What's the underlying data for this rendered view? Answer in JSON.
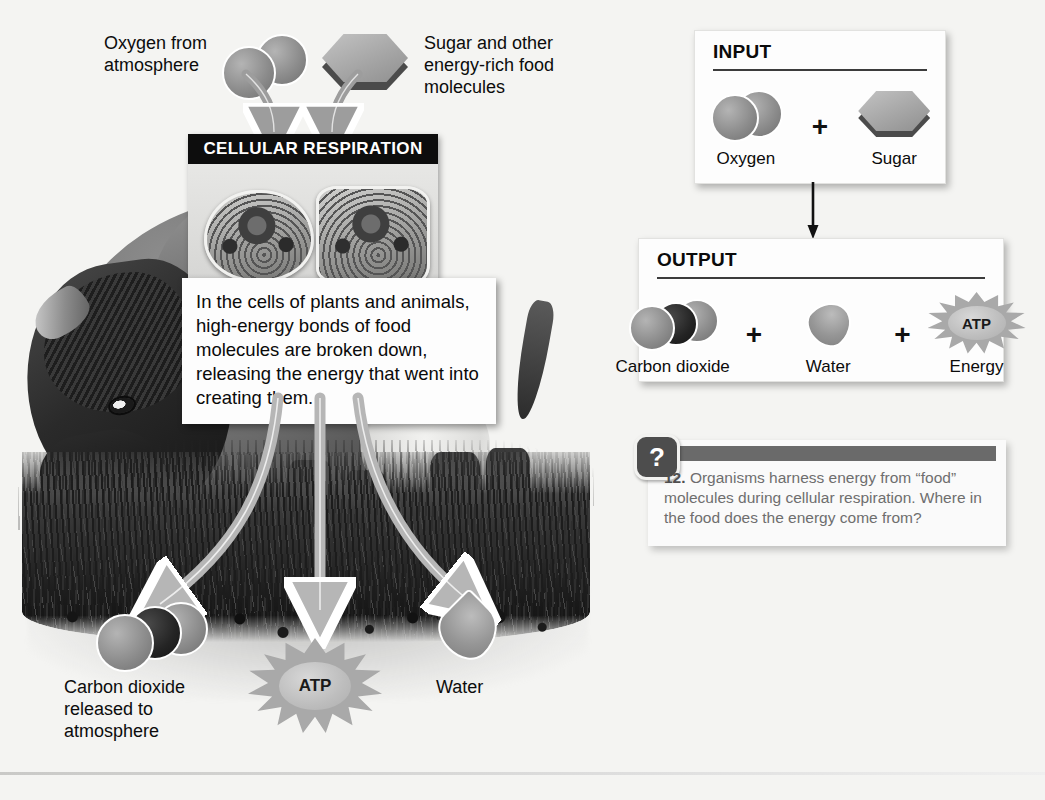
{
  "figure": {
    "topic": "Cellular Respiration",
    "panel_title": "CELLULAR RESPIRATION"
  },
  "scene_labels": {
    "oxygen_in": "Oxygen from\natmosphere",
    "oxygen_in_line1": "Oxygen from",
    "oxygen_in_line2": "atmosphere",
    "sugar_in_line1": "Sugar and other",
    "sugar_in_line2": "energy-rich food",
    "sugar_in_line3": "molecules",
    "co2_out_line1": "Carbon dioxide",
    "co2_out_line2": "released to",
    "co2_out_line3": "atmosphere",
    "atp_label": "ATP",
    "water_out": "Water"
  },
  "callout": {
    "text": "In the cells of plants and animals, high-energy bonds of food molecules are broken down, releasing the energy that went into creating them."
  },
  "input_box": {
    "heading": "INPUT",
    "items": [
      {
        "icon": "oxygen-molecule-icon",
        "label": "Oxygen"
      },
      {
        "icon": "sugar-hexagon-icon",
        "label": "Sugar"
      }
    ],
    "operators": [
      "+"
    ]
  },
  "output_box": {
    "heading": "OUTPUT",
    "items": [
      {
        "icon": "carbon-dioxide-molecule-icon",
        "label": "Carbon dioxide"
      },
      {
        "icon": "water-droplet-icon",
        "label": "Water"
      },
      {
        "icon": "atp-starburst-icon",
        "label": "Energy",
        "inner_label": "ATP"
      }
    ],
    "operators": [
      "+",
      "+"
    ]
  },
  "flow_arrow": {
    "direction": "down",
    "from": "INPUT",
    "to": "OUTPUT"
  },
  "question": {
    "icon": "question-mark-icon",
    "icon_glyph": "?",
    "number": "12.",
    "text": "Organisms harness energy from “food” molecules during cellular respiration. Where in the food does the energy come from?"
  },
  "colors": {
    "page_background": "#f4f4f2",
    "panel_title_background": "#0d0d0d",
    "panel_title_text": "#ffffff",
    "molecule_gray": "#8d8d8d",
    "molecule_dark": "#242424",
    "box_background": "#fdfdfd",
    "rule": "#3c3c3c",
    "question_bar": "#6a6a6a",
    "question_text": "#6e6e6e",
    "arrow_fill": "#a9a9a9",
    "arrow_stroke": "#ffffff"
  }
}
